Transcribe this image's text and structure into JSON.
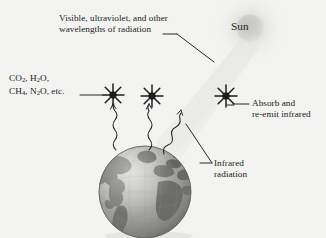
{
  "figure": {
    "background_color": "#f3f3f1",
    "text_color": "#1b1b1b"
  },
  "labels": {
    "radiation_source": {
      "line1": "Visible, ultraviolet, and other",
      "line2": "wavelengths of radiation"
    },
    "greenhouse_gases": {
      "line1_a": "CO",
      "line1_sub_a": "2",
      "line1_b": ", H",
      "line1_sub_b": "2",
      "line1_c": "O,",
      "line2_a": "CH",
      "line2_sub_a": "4",
      "line2_b": ", N",
      "line2_sub_b": "2",
      "line2_c": "O, etc."
    },
    "sun": "Sun",
    "absorb": {
      "line1": "Absorb and",
      "line2": "re-emit infrared"
    },
    "infrared": {
      "line1": "Infrared",
      "line2": "radiation"
    }
  },
  "elements": {
    "sun_glow_color": "#d8d8d6",
    "beam_color": "#e3e3e1",
    "earth_ocean_color": "#9a9a98",
    "earth_land_color": "#6f6f6d",
    "molecule_color": "#1e1e1e",
    "leader_line_color": "#1b1b1b",
    "wave_color": "#2a2a2a"
  },
  "diagram_data": {
    "type": "schematic",
    "subject": "Greenhouse effect",
    "sun": {
      "cx": 250,
      "cy": 28,
      "r": 13,
      "glow_r": 40
    },
    "earth": {
      "cx": 145,
      "cy": 192,
      "r": 46
    },
    "molecules": [
      {
        "id": "molecule-left",
        "cx": 113,
        "cy": 95,
        "points": 8
      },
      {
        "id": "molecule-center",
        "cx": 152,
        "cy": 96,
        "points": 8
      },
      {
        "id": "molecule-right",
        "cx": 226,
        "cy": 96,
        "points": 8
      }
    ],
    "infrared_waves": [
      {
        "id": "wave-left",
        "from": [
          115,
          150
        ],
        "to": [
          113,
          110
        ]
      },
      {
        "id": "wave-center",
        "from": [
          148,
          150
        ],
        "to": [
          150,
          111
        ]
      },
      {
        "id": "wave-right",
        "from": [
          167,
          152
        ],
        "to": [
          178,
          113
        ]
      }
    ],
    "incoming_beam": {
      "from": [
        246,
        44
      ],
      "to": [
        165,
        148
      ]
    }
  }
}
